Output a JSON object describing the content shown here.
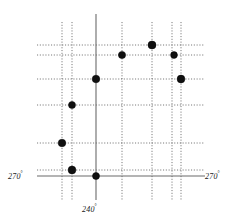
{
  "figure": {
    "title": "",
    "width": 242,
    "height": 221,
    "background_color": "#ffffff"
  },
  "labels": {
    "left": {
      "text": "270",
      "degree": "°",
      "full": "270°"
    },
    "right": {
      "text": "270",
      "degree": "°",
      "full": "270°"
    },
    "bottom": {
      "text": "240",
      "degree": "°",
      "full": "240°"
    }
  },
  "colors": {
    "axis": "#6b6b6b",
    "grid": "#555555",
    "point_fill": "#101010",
    "point_stroke": "#000000",
    "text": "#222222"
  },
  "chart_data": {
    "type": "scatter",
    "title": "",
    "xlabel": "240°",
    "ylabel": "",
    "grid": true,
    "legend": null,
    "axis_labels": {
      "left": "270°",
      "right": "270°",
      "bottom": "240°"
    },
    "xlim": [
      37,
      205
    ],
    "ylim": [
      14,
      200
    ],
    "axes": [
      {
        "name": "horizontal-axis",
        "orientation": "horizontal",
        "position": 176,
        "from": 37,
        "to": 205,
        "style": "solid"
      },
      {
        "name": "vertical-axis",
        "orientation": "vertical",
        "position": 96,
        "from": 14,
        "to": 200,
        "style": "solid"
      }
    ],
    "gridlines_vertical": [
      {
        "x": 62,
        "from": 22,
        "to": 200,
        "style": "dotted"
      },
      {
        "x": 72,
        "from": 22,
        "to": 200,
        "style": "dotted"
      },
      {
        "x": 122,
        "from": 22,
        "to": 200,
        "style": "dotted"
      },
      {
        "x": 152,
        "from": 22,
        "to": 200,
        "style": "dotted"
      },
      {
        "x": 172,
        "from": 22,
        "to": 200,
        "style": "dotted"
      },
      {
        "x": 181,
        "from": 22,
        "to": 200,
        "style": "dotted"
      }
    ],
    "gridlines_horizontal": [
      {
        "y": 45,
        "from": 37,
        "to": 205,
        "style": "dotted"
      },
      {
        "y": 55,
        "from": 37,
        "to": 205,
        "style": "dotted"
      },
      {
        "y": 79,
        "from": 37,
        "to": 205,
        "style": "dotted"
      },
      {
        "y": 105,
        "from": 37,
        "to": 205,
        "style": "dotted"
      },
      {
        "y": 143,
        "from": 37,
        "to": 205,
        "style": "dotted"
      },
      {
        "y": 170,
        "from": 37,
        "to": 205,
        "style": "dotted"
      }
    ],
    "points": [
      {
        "x": 152,
        "y": 45,
        "r": 4.0,
        "label": ""
      },
      {
        "x": 122,
        "y": 55,
        "r": 3.6,
        "label": ""
      },
      {
        "x": 174,
        "y": 55,
        "r": 3.4,
        "label": ""
      },
      {
        "x": 96,
        "y": 79,
        "r": 3.8,
        "label": ""
      },
      {
        "x": 181,
        "y": 79,
        "r": 3.9,
        "label": ""
      },
      {
        "x": 72,
        "y": 105,
        "r": 3.5,
        "label": ""
      },
      {
        "x": 62,
        "y": 143,
        "r": 3.8,
        "label": ""
      },
      {
        "x": 72,
        "y": 170,
        "r": 3.9,
        "label": ""
      },
      {
        "x": 96,
        "y": 176,
        "r": 3.5,
        "label": ""
      }
    ]
  }
}
